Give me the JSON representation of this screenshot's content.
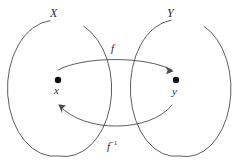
{
  "figure": {
    "stroke_color": "#4a4a55",
    "text_color": "#2b2b33",
    "point_color": "#111111",
    "background": "#ffffff"
  },
  "sets": [
    {
      "id": "X",
      "label": "X",
      "element": {
        "label": "x",
        "cx": 58,
        "cy": 80
      },
      "ellipse": {
        "cx": 59,
        "cy": 88,
        "rx": 47,
        "ry": 68
      }
    },
    {
      "id": "Y",
      "label": "Y",
      "element": {
        "label": "y",
        "cx": 176,
        "cy": 80
      },
      "ellipse": {
        "cx": 180,
        "cy": 88,
        "rx": 45,
        "ry": 68
      }
    }
  ],
  "maps": [
    {
      "id": "f",
      "label": "f",
      "superscript": "",
      "from": "x",
      "to": "y",
      "direction": "left-to-right",
      "arc": "over"
    },
    {
      "id": "f-inverse",
      "label": "f",
      "superscript": "−1",
      "from": "y",
      "to": "x",
      "direction": "right-to-left",
      "arc": "under"
    }
  ]
}
